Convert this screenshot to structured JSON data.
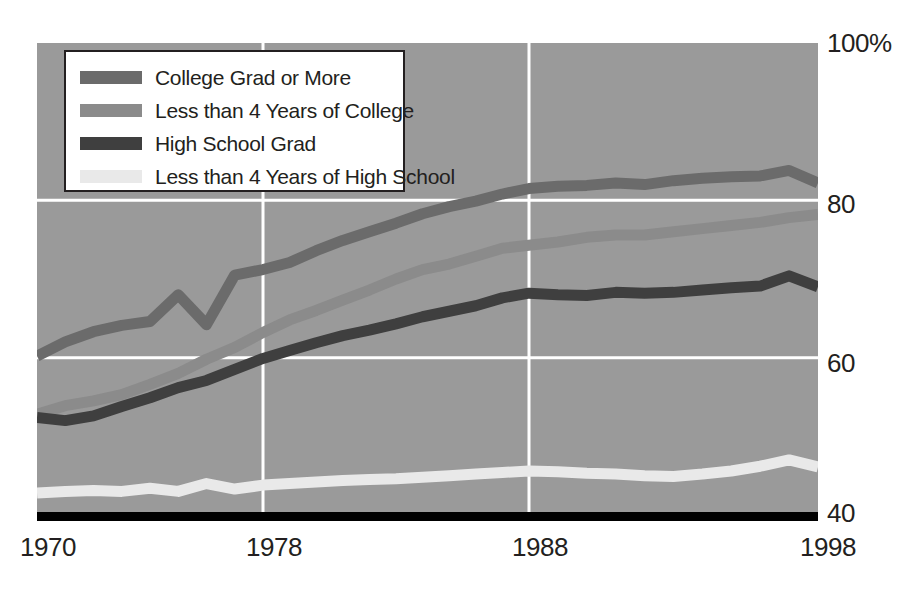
{
  "chart_data": {
    "type": "line",
    "title": "",
    "xlabel": "",
    "ylabel": "",
    "xlim": [
      1970,
      1998
    ],
    "ylim": [
      40,
      100
    ],
    "grid": true,
    "legend_position": "top-left",
    "background_color": "#9a9a9a",
    "gridline_color": "#ffffff",
    "axis_color": "#000000",
    "x_ticks": [
      "1970",
      "1978",
      "1988",
      "1998"
    ],
    "x_tick_values": [
      1970,
      1978,
      1988,
      1998
    ],
    "y_ticks": [
      "100%",
      "80",
      "60",
      "40"
    ],
    "y_tick_values": [
      100,
      80,
      60,
      40
    ],
    "x": [
      1970,
      1971,
      1972,
      1973,
      1974,
      1975,
      1976,
      1977,
      1978,
      1979,
      1980,
      1981,
      1982,
      1983,
      1984,
      1985,
      1986,
      1987,
      1988,
      1989,
      1990,
      1991,
      1992,
      1993,
      1994,
      1995,
      1996,
      1997,
      1998
    ],
    "series": [
      {
        "name": "College Grad or More",
        "color": "#6b6b6b",
        "values": [
          60.2,
          62.0,
          63.3,
          64.1,
          64.6,
          68.0,
          64.2,
          70.5,
          71.2,
          72.1,
          73.6,
          74.9,
          76.0,
          77.1,
          78.3,
          79.2,
          79.9,
          80.8,
          81.5,
          81.8,
          81.9,
          82.2,
          82.0,
          82.5,
          82.8,
          83.0,
          83.1,
          83.8,
          82.2
        ]
      },
      {
        "name": "Less than 4 Years of College",
        "color": "#8b8b8b",
        "values": [
          52.8,
          53.9,
          54.5,
          55.3,
          56.6,
          58.0,
          59.8,
          61.3,
          63.2,
          64.8,
          66.0,
          67.3,
          68.6,
          70.0,
          71.2,
          71.9,
          72.9,
          73.9,
          74.3,
          74.7,
          75.3,
          75.6,
          75.6,
          76.0,
          76.4,
          76.8,
          77.2,
          77.8,
          78.2
        ]
      },
      {
        "name": "High School Grad",
        "color": "#3f3f3f",
        "values": [
          52.4,
          52.0,
          52.6,
          53.8,
          54.9,
          56.2,
          57.1,
          58.5,
          59.9,
          60.9,
          61.9,
          62.8,
          63.5,
          64.3,
          65.2,
          65.9,
          66.6,
          67.6,
          68.2,
          68.0,
          67.9,
          68.3,
          68.2,
          68.3,
          68.6,
          68.9,
          69.1,
          70.4,
          69.0
        ]
      },
      {
        "name": "Less than 4 Years of High School",
        "color": "#e9e9e9",
        "values": [
          42.8,
          43.0,
          43.1,
          43.0,
          43.4,
          43.0,
          44.0,
          43.3,
          43.8,
          44.0,
          44.2,
          44.4,
          44.5,
          44.6,
          44.8,
          45.0,
          45.2,
          45.4,
          45.6,
          45.5,
          45.3,
          45.2,
          45.0,
          44.9,
          45.2,
          45.6,
          46.2,
          47.0,
          46.1
        ]
      }
    ]
  },
  "legend": {
    "items": [
      {
        "label": "College Grad or More",
        "color": "#6b6b6b"
      },
      {
        "label": "Less than 4 Years of College",
        "color": "#8b8b8b"
      },
      {
        "label": "High School Grad",
        "color": "#3f3f3f"
      },
      {
        "label": "Less than 4 Years of High School",
        "color": "#e9e9e9"
      }
    ]
  },
  "axes": {
    "y_labels": {
      "t100": "100%",
      "t80": "80",
      "t60": "60",
      "t40": "40"
    },
    "x_labels": {
      "t1970": "1970",
      "t1978": "1978",
      "t1988": "1988",
      "t1998": "1998"
    }
  }
}
